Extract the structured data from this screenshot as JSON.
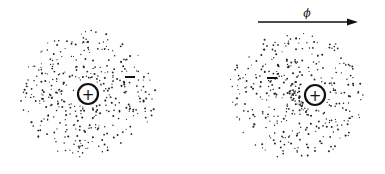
{
  "diagram": {
    "title": "",
    "panels": [
      {
        "id": "unpolarized",
        "cloud_center": [
          88,
          94
        ],
        "cloud_radius": [
          68,
          64
        ],
        "nucleus": {
          "label": "+",
          "center": [
            88,
            94
          ],
          "radius": 10
        },
        "electron_marker": {
          "label": "−",
          "center": [
            130,
            77
          ]
        }
      },
      {
        "id": "polarized",
        "cloud_center": [
          296,
          96
        ],
        "cloud_radius": [
          68,
          64
        ],
        "nucleus": {
          "label": "+",
          "center": [
            315,
            95
          ],
          "radius": 10
        },
        "electron_marker": {
          "label": "−",
          "center": [
            272,
            78
          ]
        }
      }
    ],
    "field_arrow": {
      "label": "ϕ",
      "start": [
        258,
        22
      ],
      "end": [
        358,
        22
      ]
    }
  },
  "colors": {
    "ink": "#111111",
    "background": "#ffffff"
  }
}
